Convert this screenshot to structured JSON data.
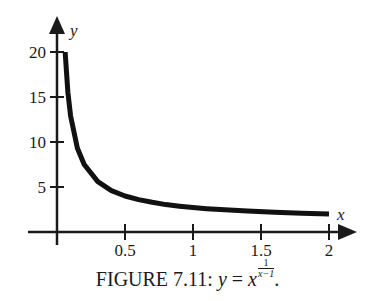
{
  "chart_data": {
    "type": "line",
    "title": "",
    "caption": "FIGURE 7.11: y = x^(1/(x-1)).",
    "xlabel": "x",
    "ylabel": "y",
    "xlim": [
      0,
      2.1
    ],
    "ylim": [
      0,
      21
    ],
    "x_ticks": [
      0.5,
      1,
      1.5,
      2
    ],
    "x_tick_labels": [
      "0.5",
      "1",
      "1.5",
      "2"
    ],
    "y_ticks": [
      5,
      10,
      15,
      20
    ],
    "y_tick_labels": [
      "5",
      "10",
      "15",
      "20"
    ],
    "grid": false,
    "legend": null,
    "series": [
      {
        "name": "y = x^(1/(x-1))",
        "x": [
          0.06,
          0.08,
          0.1,
          0.15,
          0.2,
          0.3,
          0.4,
          0.5,
          0.6,
          0.7,
          0.8,
          0.9,
          1.0,
          1.1,
          1.2,
          1.4,
          1.6,
          1.8,
          2.0
        ],
        "values": [
          19.9,
          15.5,
          12.9,
          9.3,
          7.5,
          5.6,
          4.6,
          4.0,
          3.6,
          3.3,
          3.05,
          2.87,
          2.718,
          2.59,
          2.49,
          2.32,
          2.19,
          2.08,
          2.0
        ]
      }
    ]
  },
  "labels": {
    "x_axis": "x",
    "y_axis": "y",
    "x_ticks": [
      "0.5",
      "1",
      "1.5",
      "2"
    ],
    "y_ticks": [
      "5",
      "10",
      "15",
      "20"
    ]
  },
  "caption": {
    "prefix": "FIGURE 7.11: ",
    "lhs": "y",
    "equals": " = ",
    "base": "x",
    "exp_num": "1",
    "exp_den": "x−1",
    "suffix": "."
  },
  "colors": {
    "ink": "#1a1a1a",
    "background": "#ffffff"
  }
}
